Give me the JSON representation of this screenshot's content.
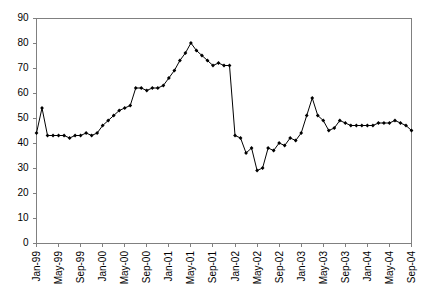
{
  "chart_data": {
    "type": "line",
    "title": "",
    "subtitle": "",
    "xlabel": "",
    "ylabel": "",
    "ylim": [
      0,
      90
    ],
    "yticks": [
      0,
      10,
      20,
      30,
      40,
      50,
      60,
      70,
      80,
      90
    ],
    "grid": false,
    "legend": null,
    "legend_position": "none",
    "marker": "filled-diamond",
    "line_color": "#000000",
    "axis_color": "#808080",
    "xtick_labels": [
      "Jan-99",
      "May-99",
      "Sep-99",
      "Jan-00",
      "May-00",
      "Sep-00",
      "Jan-01",
      "May-01",
      "Sep-01",
      "Jan-02",
      "May-02",
      "Sep-02",
      "Jan-03",
      "May-03",
      "Sep-03",
      "Jan-04",
      "May-04",
      "Sep-04"
    ],
    "xtick_interval_months": 4,
    "x": [
      "Jan-99",
      "Feb-99",
      "Mar-99",
      "Apr-99",
      "May-99",
      "Jun-99",
      "Jul-99",
      "Aug-99",
      "Sep-99",
      "Oct-99",
      "Nov-99",
      "Dec-99",
      "Jan-00",
      "Feb-00",
      "Mar-00",
      "Apr-00",
      "May-00",
      "Jun-00",
      "Jul-00",
      "Aug-00",
      "Sep-00",
      "Oct-00",
      "Nov-00",
      "Dec-00",
      "Jan-01",
      "Feb-01",
      "Mar-01",
      "Apr-01",
      "May-01",
      "Jun-01",
      "Jul-01",
      "Aug-01",
      "Sep-01",
      "Oct-01",
      "Nov-01",
      "Dec-01",
      "Jan-02",
      "Feb-02",
      "Mar-02",
      "Apr-02",
      "May-02",
      "Jun-02",
      "Jul-02",
      "Aug-02",
      "Sep-02",
      "Oct-02",
      "Nov-02",
      "Dec-02",
      "Jan-03",
      "Feb-03",
      "Mar-03",
      "Apr-03",
      "May-03",
      "Jun-03",
      "Jul-03",
      "Aug-03",
      "Sep-03",
      "Oct-03",
      "Nov-03",
      "Dec-03",
      "Jan-04",
      "Feb-04",
      "Mar-04",
      "Apr-04",
      "May-04",
      "Jun-04",
      "Jul-04",
      "Aug-04",
      "Sep-04"
    ],
    "values": [
      44,
      54,
      43,
      43,
      43,
      43,
      42,
      43,
      43,
      44,
      43,
      44,
      47,
      49,
      51,
      53,
      54,
      55,
      62,
      62,
      61,
      62,
      62,
      63,
      66,
      69,
      73,
      76,
      80,
      77,
      75,
      73,
      71,
      72,
      71,
      71,
      43,
      42,
      36,
      38,
      29,
      30,
      38,
      37,
      40,
      39,
      42,
      41,
      44,
      51,
      58,
      51,
      49,
      45,
      46,
      49,
      48,
      47,
      47,
      47,
      47,
      47,
      48,
      48,
      48,
      49,
      48,
      47,
      45
    ],
    "series_name": ""
  }
}
